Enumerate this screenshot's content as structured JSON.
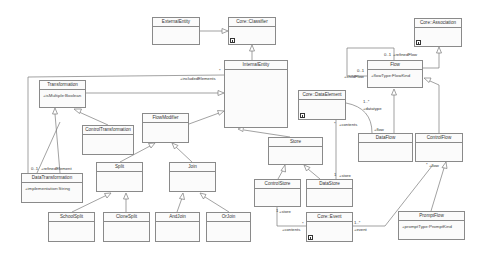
{
  "diagram": {
    "type": "uml-class-diagram",
    "classes": [
      {
        "id": "external_entity",
        "name": "ExternalEntity",
        "attributes": []
      },
      {
        "id": "core_classifier",
        "name": "Core::Classifier",
        "attributes": [],
        "library": true
      },
      {
        "id": "internal_entity",
        "name": "InternalEntity",
        "attributes": []
      },
      {
        "id": "transformation",
        "name": "Transformation",
        "attributes": [
          "+isMultiple:Boolean"
        ]
      },
      {
        "id": "control_transformation",
        "name": "ControlTransformation",
        "attributes": []
      },
      {
        "id": "flow_modifier",
        "name": "FlowModifier",
        "attributes": []
      },
      {
        "id": "split",
        "name": "Split",
        "attributes": []
      },
      {
        "id": "join",
        "name": "Join",
        "attributes": []
      },
      {
        "id": "data_transformation",
        "name": "DataTransformation",
        "attributes": [
          "+implementation:String"
        ]
      },
      {
        "id": "school_split",
        "name": "SchoolSplit",
        "attributes": []
      },
      {
        "id": "clone_split",
        "name": "CloneSplit",
        "attributes": []
      },
      {
        "id": "and_join",
        "name": "AndJoin",
        "attributes": []
      },
      {
        "id": "or_join",
        "name": "OrJoin",
        "attributes": []
      },
      {
        "id": "store",
        "name": "Store",
        "attributes": []
      },
      {
        "id": "control_store",
        "name": "ControlStore",
        "attributes": []
      },
      {
        "id": "data_store",
        "name": "DataStore",
        "attributes": []
      },
      {
        "id": "core_event",
        "name": "Core::Event",
        "attributes": [],
        "library": true
      },
      {
        "id": "core_data_element",
        "name": "Core::DataElement",
        "attributes": [],
        "library": true
      },
      {
        "id": "core_association",
        "name": "Core::Association",
        "attributes": [],
        "library": true
      },
      {
        "id": "flow",
        "name": "Flow",
        "attributes": [
          "+flowType:FlowKind"
        ]
      },
      {
        "id": "data_flow",
        "name": "DataFlow",
        "attributes": []
      },
      {
        "id": "control_flow",
        "name": "ControlFlow",
        "attributes": []
      },
      {
        "id": "prompt_flow",
        "name": "PromptFlow",
        "attributes": [
          "+promptType:PromptKind"
        ]
      }
    ],
    "generalizations": [
      [
        "ExternalEntity",
        "Core::Classifier"
      ],
      [
        "InternalEntity",
        "Core::Classifier"
      ],
      [
        "Transformation",
        "InternalEntity"
      ],
      [
        "FlowModifier",
        "InternalEntity"
      ],
      [
        "Store",
        "InternalEntity"
      ],
      [
        "ControlTransformation",
        "Transformation"
      ],
      [
        "DataTransformation",
        "Transformation"
      ],
      [
        "Split",
        "FlowModifier"
      ],
      [
        "Join",
        "FlowModifier"
      ],
      [
        "SchoolSplit",
        "Split"
      ],
      [
        "CloneSplit",
        "Split"
      ],
      [
        "AndJoin",
        "Join"
      ],
      [
        "OrJoin",
        "Join"
      ],
      [
        "ControlStore",
        "Store"
      ],
      [
        "DataStore",
        "Store"
      ],
      [
        "Flow",
        "Core::Association"
      ],
      [
        "DataFlow",
        "Flow"
      ],
      [
        "ControlFlow",
        "Flow"
      ],
      [
        "PromptFlow",
        "ControlFlow"
      ]
    ],
    "labels": {
      "included_elements": "+includedElements",
      "included_mult": "*",
      "refined_element": "+refinedElement",
      "refined_element_mult": "0..1",
      "refined_flow": "+refinedFlow",
      "refined_flow_mult": "0..1",
      "child_flow": "+childFlow",
      "child_flow_mult": "0..1",
      "datatype": "+datatype",
      "datatype_mult": "1..*",
      "flow_role": "+flow",
      "contents_de": "+contents",
      "contents_de_mult": "*",
      "store_ds": "+store",
      "store_ds_mult": "1",
      "store_cs": "+store",
      "store_cs_mult": "1",
      "contents_ev": "+contents",
      "contents_ev_mult": "*",
      "event": "+event",
      "event_mult": "1..*",
      "cf_flow": "+flow",
      "cf_flow_mult": "*"
    }
  }
}
